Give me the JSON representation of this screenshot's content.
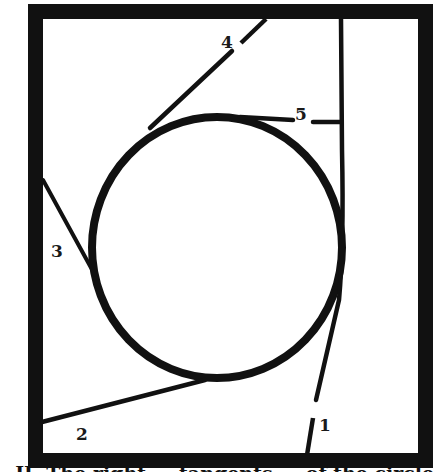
{
  "figure": {
    "type": "tangent-lines-to-circle-in-frame",
    "frame": {
      "color": "#111111",
      "stroke_width": 15
    },
    "circle": {
      "color": "#111111",
      "stroke_width": 8
    },
    "lines": [
      {
        "id": "1",
        "label": "1"
      },
      {
        "id": "2",
        "label": "2"
      },
      {
        "id": "3",
        "label": "3"
      },
      {
        "id": "4",
        "label": "4"
      },
      {
        "id": "5",
        "label": "5"
      }
    ]
  },
  "caption": {
    "text": ". II. The right ... tangents ... of the circle"
  }
}
